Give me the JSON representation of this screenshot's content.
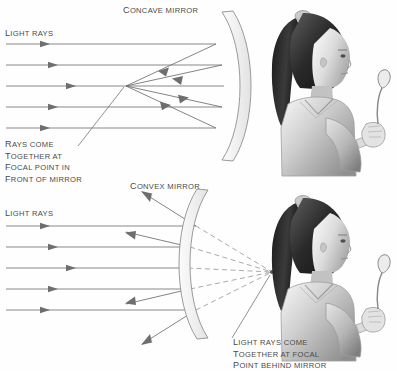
{
  "figure": {
    "background_color": "#fefefe",
    "ink_color": "#6b6b6b",
    "text_color": "#4a4a4a"
  },
  "panels": [
    {
      "id": "concave",
      "mirror_label": "Concave mirror",
      "rays_label": "Light rays",
      "caption_lines": [
        "Rays come",
        "together at",
        "focal point in",
        "front of mirror"
      ],
      "mirror_type": "concave",
      "focal_point": {
        "x": 126,
        "y": 86,
        "kind": "real",
        "side": "front of mirror"
      },
      "incoming_ray_y": [
        44,
        65,
        86,
        107,
        128
      ],
      "incoming_ray_x_start": 6,
      "incoming_ray_arrow_x": 48,
      "mirror_hit_x": [
        216,
        222,
        224,
        222,
        216
      ],
      "observer": {
        "figure": "girl-with-spoon",
        "facing": "left",
        "holding": "spoon"
      }
    },
    {
      "id": "convex",
      "mirror_label": "Convex mirror",
      "rays_label": "Light rays",
      "caption_lines": [
        "Light rays come",
        "together at focal",
        "point behind mirror"
      ],
      "mirror_type": "convex",
      "focal_point": {
        "x": 272,
        "y": 272,
        "kind": "virtual",
        "side": "behind mirror"
      },
      "incoming_ray_y": [
        226,
        247,
        268,
        289,
        310
      ],
      "incoming_ray_x_start": 6,
      "incoming_ray_arrow_x": 48,
      "mirror_hit_x": [
        196,
        190,
        188,
        190,
        196
      ],
      "observer": {
        "figure": "girl-with-spoon",
        "facing": "left",
        "holding": "spoon"
      }
    }
  ],
  "icons": {
    "arrow": "arrowhead-icon",
    "mirror_arc": "mirror-arc-icon",
    "focal_dot": "focal-point-icon"
  }
}
